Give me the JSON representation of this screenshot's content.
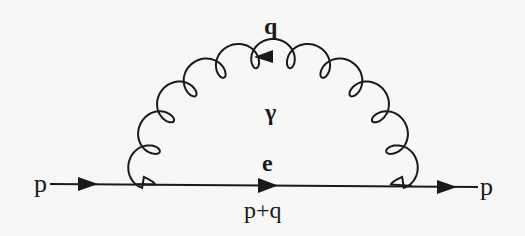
{
  "diagram": {
    "type": "feynman-diagram",
    "colors": {
      "ink": "#1a1a1a",
      "background": "#f7f7f5"
    },
    "labels": {
      "incoming_momentum": "p",
      "outgoing_momentum": "p",
      "photon_momentum": "q",
      "photon_symbol": "γ",
      "internal_fermion": "e",
      "internal_momentum": "p+q"
    },
    "lines": [
      {
        "kind": "fermion",
        "from": "in",
        "to": "vertex1",
        "arrow": "right"
      },
      {
        "kind": "fermion",
        "from": "vertex1",
        "to": "vertex2",
        "arrow": "right"
      },
      {
        "kind": "fermion",
        "from": "vertex2",
        "to": "out",
        "arrow": "right"
      },
      {
        "kind": "photon",
        "from": "vertex1",
        "to": "vertex2",
        "arrow": "left"
      }
    ]
  }
}
